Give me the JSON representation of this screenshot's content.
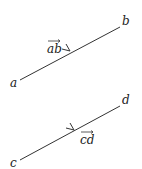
{
  "diagram": {
    "vectors": [
      {
        "id": "ab",
        "start_label": "a",
        "end_label": "b",
        "vector_label": "ab",
        "label_position": "above-left",
        "start": [
          20,
          80
        ],
        "end": [
          120,
          27
        ]
      },
      {
        "id": "cd",
        "start_label": "c",
        "end_label": "d",
        "vector_label": "cd",
        "label_position": "below-right",
        "start": [
          20,
          160
        ],
        "end": [
          120,
          106
        ]
      }
    ],
    "colors": {
      "line": "#333333",
      "text": "#222222",
      "background": "#ffffff"
    }
  }
}
